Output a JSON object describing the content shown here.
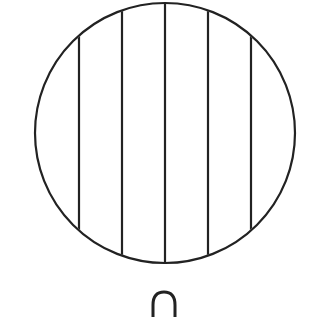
{
  "figure": {
    "stroke_color": "#222222",
    "background": "#ffffff",
    "circle": {
      "cx": 165,
      "cy": 133,
      "r": 130
    },
    "vertical_lines_x": [
      79,
      122,
      165,
      208,
      251
    ],
    "bottom_shape": {
      "type": "loop",
      "cx": 164,
      "top_y": 292
    }
  }
}
